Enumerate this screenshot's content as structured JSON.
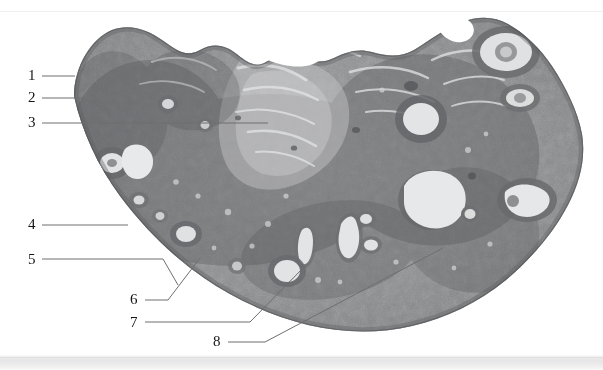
{
  "figure": {
    "kind": "histology-micrograph",
    "background_color": "#ffffff",
    "footer_band_color": "#e6e6e8",
    "tissue_colors": {
      "cortex_mid_gray": "#8f9092",
      "dark_stroma": "#6d6e70",
      "light_follicle": "#d9dadb",
      "highlight": "#f2f2f2",
      "outline": "#5a5b5d"
    },
    "leader_line_color": "#6e6e6e",
    "label_text_color": "#141414"
  },
  "callouts": [
    {
      "id": "1",
      "label": "1",
      "x": 28,
      "y": 68
    },
    {
      "id": "2",
      "label": "2",
      "x": 28,
      "y": 90
    },
    {
      "id": "3",
      "label": "3",
      "x": 28,
      "y": 115
    },
    {
      "id": "4",
      "label": "4",
      "x": 28,
      "y": 217
    },
    {
      "id": "5",
      "label": "5",
      "x": 28,
      "y": 252
    },
    {
      "id": "6",
      "label": "6",
      "x": 130,
      "y": 292
    },
    {
      "id": "7",
      "label": "7",
      "x": 130,
      "y": 315
    },
    {
      "id": "8",
      "label": "8",
      "x": 213,
      "y": 334
    }
  ],
  "leader_lines": [
    {
      "for": "1",
      "points": "42,76 75,76"
    },
    {
      "for": "2",
      "points": "42,98 82,98 108,110"
    },
    {
      "for": "3",
      "points": "42,123 268,123"
    },
    {
      "for": "4",
      "points": "42,225 128,225"
    },
    {
      "for": "5",
      "points": "42,259 163,259 178,285"
    },
    {
      "for": "6",
      "points": "145,300 168,300 200,258"
    },
    {
      "for": "7",
      "points": "145,322 250,322 307,264"
    },
    {
      "for": "8",
      "points": "228,342 265,342 443,248"
    }
  ]
}
